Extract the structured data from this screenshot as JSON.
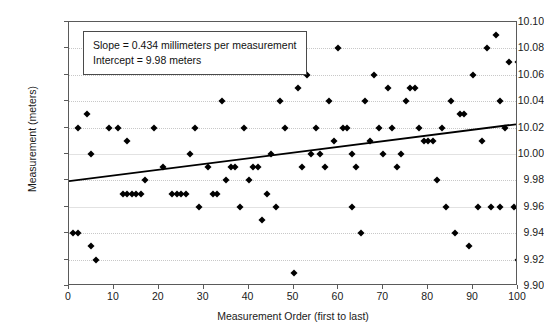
{
  "chart_data": {
    "type": "scatter",
    "title": "",
    "xlabel": "Measurement Order (first to last)",
    "ylabel": "Measurement (meters)",
    "xlim": [
      0,
      100
    ],
    "ylim": [
      9.9,
      10.1
    ],
    "xticks": [
      0,
      10,
      20,
      30,
      40,
      50,
      60,
      70,
      80,
      90,
      100
    ],
    "yticks": [
      9.9,
      9.92,
      9.94,
      9.96,
      9.98,
      10.0,
      10.02,
      10.04,
      10.06,
      10.08,
      10.1
    ],
    "ytick_labels": [
      "9.90",
      "9.92",
      "9.94",
      "9.96",
      "9.98",
      "10.00",
      "10.02",
      "10.04",
      "10.06",
      "10.08",
      "10.10"
    ],
    "xtick_labels": [
      "0",
      "10",
      "20",
      "30",
      "40",
      "50",
      "60",
      "70",
      "80",
      "90",
      "100"
    ],
    "grid": true,
    "grid_color": "#c8c8c8",
    "marker": "diamond",
    "marker_color": "#000000",
    "legend": "none",
    "annotations": {
      "slope_text": "Slope = 0.434 millimeters per measurement",
      "intercept_text": "Intercept = 9.98 meters"
    },
    "fit_line": {
      "slope_mm_per_measurement": 0.434,
      "intercept_meters": 9.98,
      "x_start": 0,
      "y_start": 9.9785,
      "x_end": 100,
      "y_end": 10.0219,
      "color": "#000000"
    },
    "points": [
      [
        1,
        9.94
      ],
      [
        2,
        9.94
      ],
      [
        2,
        10.02
      ],
      [
        4,
        10.03
      ],
      [
        5,
        9.93
      ],
      [
        5,
        10.0
      ],
      [
        6,
        9.92
      ],
      [
        9,
        10.02
      ],
      [
        11,
        10.02
      ],
      [
        12,
        9.97
      ],
      [
        13,
        9.97
      ],
      [
        13,
        10.01
      ],
      [
        14,
        9.97
      ],
      [
        15,
        9.97
      ],
      [
        16,
        9.97
      ],
      [
        17,
        9.98
      ],
      [
        19,
        10.02
      ],
      [
        21,
        9.99
      ],
      [
        23,
        9.97
      ],
      [
        24,
        9.97
      ],
      [
        25,
        9.97
      ],
      [
        26,
        9.97
      ],
      [
        27,
        10.0
      ],
      [
        28,
        10.02
      ],
      [
        29,
        9.96
      ],
      [
        31,
        9.99
      ],
      [
        32,
        9.97
      ],
      [
        33,
        9.97
      ],
      [
        34,
        10.04
      ],
      [
        35,
        9.98
      ],
      [
        36,
        9.99
      ],
      [
        37,
        9.99
      ],
      [
        38,
        9.96
      ],
      [
        39,
        10.02
      ],
      [
        40,
        9.98
      ],
      [
        41,
        9.99
      ],
      [
        42,
        9.99
      ],
      [
        43,
        9.95
      ],
      [
        44,
        9.97
      ],
      [
        45,
        10.0
      ],
      [
        46,
        9.96
      ],
      [
        47,
        10.04
      ],
      [
        48,
        10.02
      ],
      [
        50,
        9.91
      ],
      [
        51,
        10.05
      ],
      [
        52,
        9.99
      ],
      [
        53,
        10.06
      ],
      [
        54,
        10.0
      ],
      [
        55,
        10.02
      ],
      [
        56,
        10.0
      ],
      [
        57,
        9.99
      ],
      [
        58,
        10.04
      ],
      [
        59,
        10.01
      ],
      [
        60,
        10.08
      ],
      [
        61,
        10.02
      ],
      [
        62,
        10.02
      ],
      [
        63,
        10.0
      ],
      [
        63,
        9.96
      ],
      [
        64,
        9.99
      ],
      [
        65,
        9.94
      ],
      [
        66,
        10.04
      ],
      [
        67,
        10.01
      ],
      [
        68,
        10.06
      ],
      [
        69,
        10.02
      ],
      [
        70,
        10.0
      ],
      [
        71,
        10.05
      ],
      [
        72,
        10.02
      ],
      [
        73,
        9.99
      ],
      [
        74,
        10.0
      ],
      [
        75,
        10.04
      ],
      [
        76,
        10.05
      ],
      [
        77,
        10.05
      ],
      [
        78,
        10.02
      ],
      [
        79,
        10.01
      ],
      [
        80,
        10.01
      ],
      [
        81,
        10.01
      ],
      [
        82,
        9.98
      ],
      [
        83,
        10.02
      ],
      [
        84,
        9.96
      ],
      [
        85,
        10.04
      ],
      [
        86,
        9.94
      ],
      [
        87,
        10.03
      ],
      [
        88,
        10.03
      ],
      [
        89,
        9.93
      ],
      [
        90,
        10.06
      ],
      [
        91,
        9.96
      ],
      [
        92,
        10.01
      ],
      [
        93,
        10.08
      ],
      [
        94,
        9.96
      ],
      [
        95,
        10.09
      ],
      [
        96,
        10.04
      ],
      [
        96,
        9.96
      ],
      [
        97,
        10.02
      ],
      [
        98,
        10.07
      ],
      [
        99,
        9.96
      ],
      [
        100,
        10.07
      ],
      [
        100,
        9.92
      ]
    ]
  }
}
